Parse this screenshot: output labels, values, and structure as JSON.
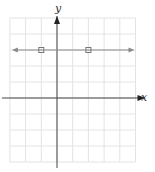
{
  "chart_data": {
    "type": "line",
    "title": "",
    "xlabel": "x",
    "ylabel": "y",
    "xlim": [
      -3,
      5
    ],
    "ylim": [
      -4,
      5
    ],
    "grid": true,
    "legend": null,
    "series": [
      {
        "name": "y = 3",
        "equation": "y = 3",
        "line": {
          "y": 3,
          "arrows": "both"
        },
        "points": [
          {
            "x": -1,
            "y": 3
          },
          {
            "x": 2,
            "y": 3
          }
        ]
      }
    ]
  },
  "labels": {
    "x_axis": "x",
    "y_axis": "y"
  },
  "colors": {
    "grid": "#e3e3e3",
    "axis": "#444444",
    "line": "#8a8a8a",
    "point": "#777777"
  }
}
